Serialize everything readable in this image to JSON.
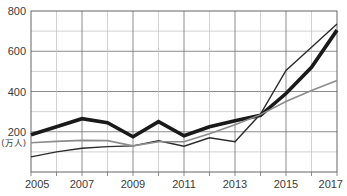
{
  "chart_data": {
    "type": "line",
    "title": "",
    "xlabel": "",
    "ylabel": "",
    "y_unit_label": "(万人)",
    "x": [
      2005,
      2006,
      2007,
      2008,
      2009,
      2010,
      2011,
      2012,
      2013,
      2014,
      2015,
      2016,
      2017
    ],
    "xlim": [
      2005,
      2017
    ],
    "ylim": [
      0,
      800
    ],
    "x_tick_labels": [
      "2005",
      "2007",
      "2009",
      "2011",
      "2013",
      "2015",
      "2017"
    ],
    "x_tick_values": [
      2005,
      2007,
      2009,
      2011,
      2013,
      2015,
      2017
    ],
    "y_tick_labels": [
      "200",
      "400",
      "600",
      "800"
    ],
    "y_tick_values": [
      200,
      400,
      600,
      800
    ],
    "y_minor_gridlines": [
      100,
      300,
      500,
      700
    ],
    "grid": true,
    "legend": "none",
    "series": [
      {
        "name": "series-thick-black",
        "style": "thick-black",
        "color": "#1a1a1a",
        "width": 3.6,
        "values": [
          185,
          225,
          265,
          245,
          175,
          250,
          180,
          225,
          255,
          282,
          390,
          520,
          705
        ]
      },
      {
        "name": "series-thin-dark",
        "style": "thin-dark",
        "color": "#2b2b2b",
        "width": 1.4,
        "values": [
          75,
          100,
          118,
          126,
          130,
          155,
          128,
          170,
          150,
          288,
          505,
          620,
          735
        ]
      },
      {
        "name": "series-gray",
        "style": "thin-gray",
        "color": "#8c8c8c",
        "width": 1.6,
        "values": [
          145,
          152,
          157,
          156,
          130,
          150,
          150,
          190,
          235,
          285,
          350,
          405,
          455
        ]
      }
    ]
  }
}
